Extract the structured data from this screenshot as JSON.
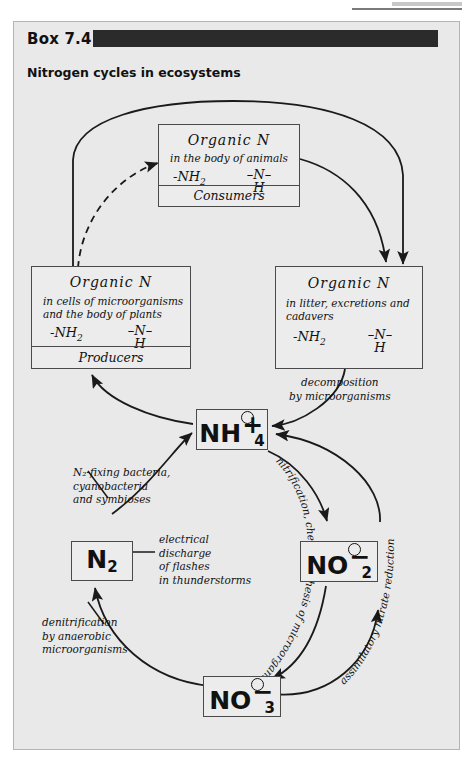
{
  "page": {
    "box_label": "Box 7.4",
    "subtitle": "Nitrogen cycles in ecosystems"
  },
  "nodes": {
    "consumers": {
      "title": "Organic   N",
      "sub": "in the body of animals",
      "form_left": "-NH",
      "form_left_sub": "2",
      "form_right_top": "–N–",
      "form_right_bottom": "H",
      "footer": "Consumers"
    },
    "producers": {
      "title": "Organic   N",
      "sub_line1": "in cells of microorganisms",
      "sub_line2": "and the body of plants",
      "form_left": "-NH",
      "form_left_sub": "2",
      "form_right_top": "–N–",
      "form_right_bottom": "H",
      "footer": "Producers"
    },
    "litter": {
      "title": "Organic   N",
      "sub_line1": "in litter, excretions and",
      "sub_line2": "cadavers",
      "form_left": "-NH",
      "form_left_sub": "2",
      "form_right_top": "–N–",
      "form_right_bottom": "H"
    },
    "ammonium": {
      "formula": "NH",
      "sub": "4",
      "charge": "+"
    },
    "dinitrogen": {
      "formula": "N",
      "sub": "2",
      "charge": ""
    },
    "nitrite": {
      "formula": "NO",
      "sub": "2",
      "charge": "−"
    },
    "nitrate": {
      "formula": "NO",
      "sub": "3",
      "charge": "−"
    }
  },
  "annotations": {
    "decomposition": {
      "line1": "decomposition",
      "line2": "by microorganisms"
    },
    "fixing": {
      "line1": "N₂-fixing bacteria,",
      "line2": "cyanobacteria",
      "line3": "and symbioses"
    },
    "electrical": {
      "line1": "electrical",
      "line2": "discharge",
      "line3": "of flashes",
      "line4": "in thunderstorms"
    },
    "denitrification": {
      "line1": "denitrification",
      "line2": "by anaerobic",
      "line3": "microorganisms"
    },
    "nitrification_curve": "nitrification, chemosynthesis of microorganisms",
    "assimilatory_curve": "assimilatory   nitrate   reduction"
  },
  "colors": {
    "panel_bg": "#e9e9e9",
    "headbar": "#2b2b2b",
    "stroke": "#1a1a1a",
    "box_border": "#4a4a4a"
  }
}
